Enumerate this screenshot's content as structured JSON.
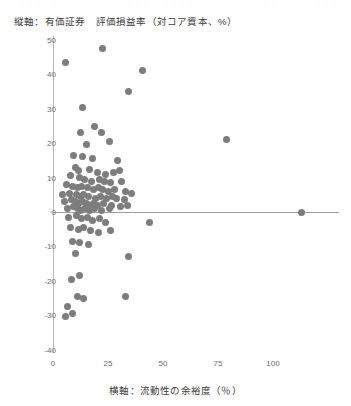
{
  "figure": {
    "title": "縦軸：有価証券　評価損益率（対コア資本、%）",
    "xaxis_label": "横軸：流動性の余裕度（％）",
    "top_bleed_text": "··· ···· ···· ···· ···· ··· ··· ·· ··· ····",
    "marker_color": "#7d7d7d",
    "axis_color": "#b9b9bd",
    "zero_line_color": "#9d9d9d",
    "background": "#ffffff"
  },
  "chart_data": {
    "type": "scatter",
    "title": "縦軸：有価証券　評価損益率（対コア資本、%）",
    "xlabel": "横軸：流動性の余裕度（％）",
    "ylabel": "有価証券 評価損益率（対コア資本、%）",
    "xlim": [
      -2,
      118
    ],
    "ylim": [
      -40,
      52
    ],
    "xticks": [
      0,
      25,
      50,
      75,
      100
    ],
    "yticks": [
      50,
      40,
      30,
      20,
      10,
      0,
      -10,
      -20,
      -30,
      -40
    ],
    "grid": false,
    "legend": null,
    "zero_line": 0,
    "marker": "circle",
    "marker_color": "#7d7d7d",
    "n_points": 96,
    "points": [
      [
        5.5,
        43.5
      ],
      [
        22.5,
        47.5
      ],
      [
        40.5,
        41.0
      ],
      [
        34.5,
        35.0
      ],
      [
        13.5,
        30.5
      ],
      [
        19.0,
        25.0
      ],
      [
        12.5,
        23.0
      ],
      [
        22.0,
        23.0
      ],
      [
        79.0,
        21.0
      ],
      [
        25.5,
        20.5
      ],
      [
        15.0,
        19.5
      ],
      [
        9.5,
        16.5
      ],
      [
        13.5,
        16.0
      ],
      [
        18.0,
        15.5
      ],
      [
        29.5,
        15.0
      ],
      [
        10.0,
        13.0
      ],
      [
        11.5,
        12.0
      ],
      [
        16.5,
        12.5
      ],
      [
        20.0,
        11.5
      ],
      [
        24.0,
        11.0
      ],
      [
        27.5,
        11.5
      ],
      [
        30.0,
        12.0
      ],
      [
        8.0,
        10.5
      ],
      [
        12.0,
        10.0
      ],
      [
        14.5,
        9.5
      ],
      [
        17.5,
        9.0
      ],
      [
        21.0,
        9.5
      ],
      [
        23.5,
        9.0
      ],
      [
        26.0,
        8.5
      ],
      [
        31.0,
        9.0
      ],
      [
        6.0,
        8.0
      ],
      [
        9.0,
        7.5
      ],
      [
        11.0,
        7.0
      ],
      [
        13.0,
        7.5
      ],
      [
        15.5,
        7.0
      ],
      [
        18.5,
        6.5
      ],
      [
        20.5,
        7.0
      ],
      [
        22.5,
        6.5
      ],
      [
        25.0,
        6.0
      ],
      [
        28.0,
        6.5
      ],
      [
        33.0,
        6.0
      ],
      [
        35.5,
        5.5
      ],
      [
        4.5,
        5.0
      ],
      [
        7.5,
        5.5
      ],
      [
        10.5,
        5.0
      ],
      [
        12.5,
        4.5
      ],
      [
        14.0,
        5.0
      ],
      [
        16.0,
        4.5
      ],
      [
        19.5,
        4.0
      ],
      [
        21.5,
        4.5
      ],
      [
        24.5,
        4.0
      ],
      [
        27.0,
        4.5
      ],
      [
        29.0,
        4.0
      ],
      [
        32.5,
        3.5
      ],
      [
        5.0,
        3.0
      ],
      [
        8.5,
        3.5
      ],
      [
        10.0,
        3.0
      ],
      [
        11.5,
        2.5
      ],
      [
        13.5,
        3.0
      ],
      [
        15.0,
        2.5
      ],
      [
        17.0,
        2.0
      ],
      [
        18.5,
        2.5
      ],
      [
        20.0,
        2.0
      ],
      [
        23.0,
        2.5
      ],
      [
        26.5,
        2.0
      ],
      [
        30.5,
        1.5
      ],
      [
        34.0,
        2.0
      ],
      [
        6.5,
        1.0
      ],
      [
        9.5,
        1.5
      ],
      [
        11.0,
        1.0
      ],
      [
        12.5,
        0.5
      ],
      [
        14.5,
        1.0
      ],
      [
        16.5,
        0.5
      ],
      [
        19.0,
        1.0
      ],
      [
        22.0,
        0.5
      ],
      [
        25.5,
        1.0
      ],
      [
        113.0,
        0.0
      ],
      [
        7.0,
        -1.5
      ],
      [
        10.5,
        -1.0
      ],
      [
        13.0,
        -2.0
      ],
      [
        15.5,
        -1.5
      ],
      [
        18.0,
        -2.5
      ],
      [
        21.0,
        -2.0
      ],
      [
        24.0,
        -3.0
      ],
      [
        44.0,
        -3.0
      ],
      [
        8.0,
        -4.5
      ],
      [
        11.5,
        -5.0
      ],
      [
        14.0,
        -4.5
      ],
      [
        17.0,
        -5.5
      ],
      [
        20.5,
        -6.0
      ],
      [
        26.0,
        -5.5
      ],
      [
        9.0,
        -8.5
      ],
      [
        12.0,
        -9.0
      ],
      [
        16.0,
        -9.5
      ],
      [
        10.0,
        -12.0
      ],
      [
        34.5,
        -13.0
      ],
      [
        8.5,
        -19.5
      ],
      [
        12.0,
        -18.5
      ],
      [
        11.0,
        -24.5
      ],
      [
        14.0,
        -25.0
      ],
      [
        33.0,
        -24.5
      ],
      [
        6.5,
        -27.5
      ],
      [
        5.5,
        -30.5
      ],
      [
        9.0,
        -29.5
      ]
    ]
  }
}
